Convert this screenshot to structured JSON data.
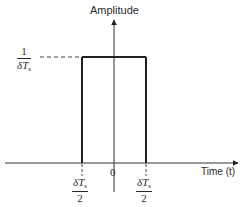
{
  "diagram": {
    "y_axis_label": "Amplitude",
    "x_axis_label": "Time (t)",
    "origin_label": "0",
    "amplitude_label": {
      "numerator": "1",
      "denominator_delta": "δ",
      "denominator_var": "T",
      "denominator_sub": "s"
    },
    "left_edge_label": {
      "numerator_delta": "δ",
      "numerator_var": "T",
      "numerator_sub": "s",
      "denominator": "2"
    },
    "right_edge_label": {
      "numerator_delta": "δ",
      "numerator_var": "T",
      "numerator_sub": "s",
      "denominator": "2"
    },
    "pulse": {
      "amplitude": "1/δTs",
      "start": "-δTs/2",
      "end": "δTs/2"
    },
    "colors": {
      "line": "#222222",
      "background": "#ffffff"
    }
  }
}
